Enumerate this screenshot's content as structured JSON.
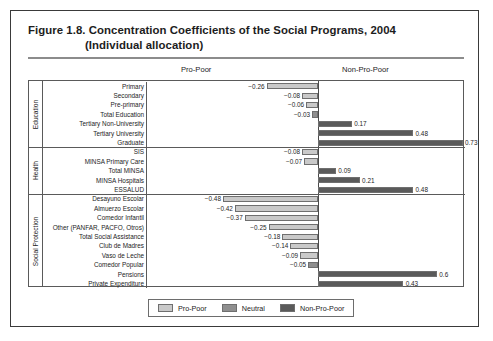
{
  "figure": {
    "title_line1": "Figure 1.8.  Concentration Coefficients of the Social Programs, 2004",
    "title_line2": "(Individual allocation)"
  },
  "headers": {
    "left": "Pro-Poor",
    "right": "Non-Pro-Poor"
  },
  "legend": {
    "items": [
      {
        "label": "Pro-Poor",
        "swatch": "propoor",
        "color": "#c9c9c9"
      },
      {
        "label": "Neutral",
        "swatch": "neutral",
        "color": "#8f8f8f"
      },
      {
        "label": "Non-Pro-Poor",
        "swatch": "nonpropoor",
        "color": "#5a5a5a"
      }
    ]
  },
  "groups": [
    {
      "name": "Education",
      "count": 7
    },
    {
      "name": "Health",
      "count": 5
    },
    {
      "name": "Social Protection",
      "count": 10
    }
  ],
  "chart_data": {
    "type": "bar",
    "orientation": "horizontal",
    "title": "Figure 1.8.  Concentration Coefficients of the Social Programs, 2004 (Individual allocation)",
    "xlabel": "",
    "ylabel": "",
    "xlim": [
      -0.55,
      0.8
    ],
    "grid": false,
    "legend_position": "bottom",
    "categories": [
      "Primary",
      "Secondary",
      "Pre-primary",
      "Total Education",
      "Tertiary Non-University",
      "Tertiary University",
      "Graduate",
      "SIS",
      "MINSA Primary Care",
      "Total MINSA",
      "MINSA Hospitals",
      "ESSALUD",
      "Desayuno Escolar",
      "Almuerzo Escolar",
      "Comedor Infantil",
      "Other (PANFAR, PACFO, Otros)",
      "Total Social Assistance",
      "Club de Madres",
      "Vaso de Leche",
      "Comedor Popular",
      "Pensions",
      "Private Expenditure"
    ],
    "values": [
      -0.26,
      -0.08,
      -0.06,
      -0.03,
      0.17,
      0.48,
      0.73,
      -0.08,
      -0.07,
      0.09,
      0.21,
      0.48,
      -0.48,
      -0.42,
      -0.37,
      -0.25,
      -0.18,
      -0.14,
      -0.09,
      -0.05,
      0.6,
      0.43
    ],
    "value_labels": [
      "−0.26",
      "−0.08",
      "−0.06",
      "−0.03",
      "0.17",
      "0.48",
      "0.73",
      "−0.08",
      "−0.07",
      "0.09",
      "0.21",
      "0.48",
      "−0.48",
      "−0.42",
      "−0.37",
      "−0.25",
      "−0.18",
      "−0.14",
      "−0.09",
      "−0.05",
      "0.6",
      "0.43"
    ],
    "series_class": [
      "propoor",
      "propoor",
      "propoor",
      "neutral",
      "nonpropoor",
      "nonpropoor",
      "nonpropoor",
      "propoor",
      "propoor",
      "nonpropoor",
      "nonpropoor",
      "nonpropoor",
      "propoor",
      "propoor",
      "propoor",
      "propoor",
      "propoor",
      "propoor",
      "propoor",
      "neutral",
      "nonpropoor",
      "nonpropoor"
    ],
    "series": [
      {
        "name": "Pro-Poor",
        "color": "#c9c9c9"
      },
      {
        "name": "Neutral",
        "color": "#8f8f8f"
      },
      {
        "name": "Non-Pro-Poor",
        "color": "#5a5a5a"
      }
    ]
  }
}
